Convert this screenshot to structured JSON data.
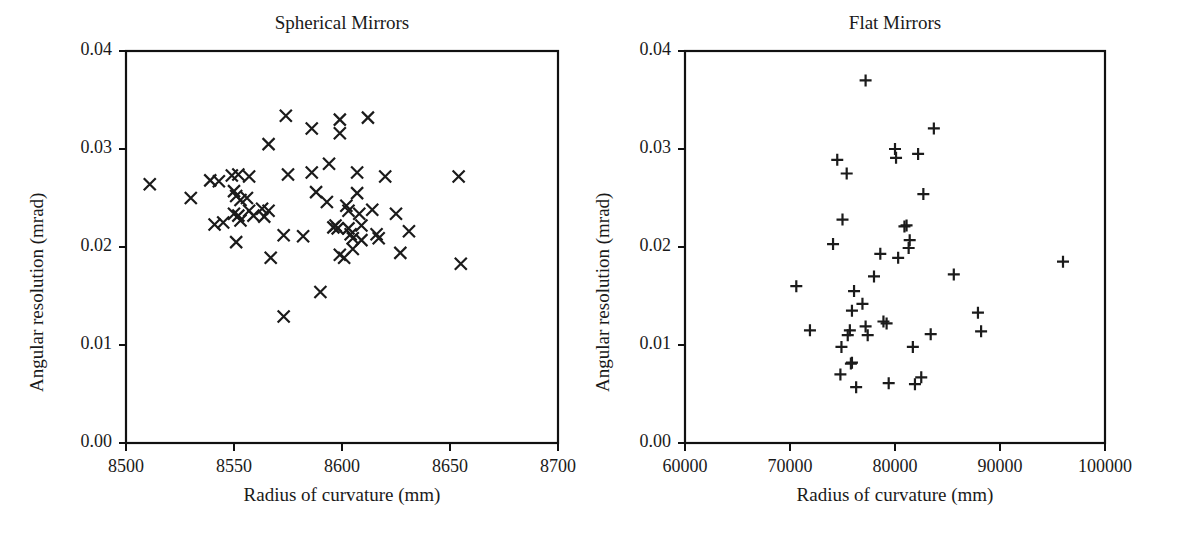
{
  "figure": {
    "width": 1178,
    "height": 535,
    "background": "#ffffff",
    "ink_color": "#1a1a1a"
  },
  "chart_data": [
    {
      "type": "scatter",
      "panel": "left",
      "title": "Spherical Mirrors",
      "xlabel": "Radius of curvature (mm)",
      "ylabel": "Angular resolution (mrad)",
      "xlim": [
        8500,
        8700
      ],
      "ylim": [
        0.0,
        0.04
      ],
      "xticks": [
        8500,
        8550,
        8600,
        8650,
        8700
      ],
      "xticklabels": [
        "8500",
        "8550",
        "8600",
        "8650",
        "8700"
      ],
      "yticks": [
        0.0,
        0.01,
        0.02,
        0.03,
        0.04
      ],
      "yticklabels": [
        "0.00",
        "0.01",
        "0.02",
        "0.03",
        "0.04"
      ],
      "grid": false,
      "legend": "none",
      "marker": "x",
      "marker_color": "#1b1b1b",
      "n_points": 63,
      "points": [
        [
          8511,
          0.0264
        ],
        [
          8530,
          0.025
        ],
        [
          8539,
          0.0268
        ],
        [
          8543,
          0.0267
        ],
        [
          8541,
          0.0223
        ],
        [
          8545,
          0.0225
        ],
        [
          8549,
          0.0273
        ],
        [
          8552,
          0.0274
        ],
        [
          8550,
          0.0257
        ],
        [
          8551,
          0.0252
        ],
        [
          8553,
          0.0248
        ],
        [
          8550,
          0.0234
        ],
        [
          8552,
          0.0232
        ],
        [
          8553,
          0.0227
        ],
        [
          8551,
          0.0205
        ],
        [
          8557,
          0.0272
        ],
        [
          8556,
          0.025
        ],
        [
          8557,
          0.0237
        ],
        [
          8559,
          0.0232
        ],
        [
          8563,
          0.0239
        ],
        [
          8566,
          0.0237
        ],
        [
          8564,
          0.0231
        ],
        [
          8566,
          0.0305
        ],
        [
          8567,
          0.0189
        ],
        [
          8574,
          0.0334
        ],
        [
          8575,
          0.0274
        ],
        [
          8573,
          0.0212
        ],
        [
          8573,
          0.0129
        ],
        [
          8582,
          0.0211
        ],
        [
          8586,
          0.0321
        ],
        [
          8586,
          0.0276
        ],
        [
          8588,
          0.0256
        ],
        [
          8590,
          0.0154
        ],
        [
          8594,
          0.0285
        ],
        [
          8593,
          0.0246
        ],
        [
          8596,
          0.022
        ],
        [
          8597,
          0.0222
        ],
        [
          8598,
          0.0219
        ],
        [
          8599,
          0.033
        ],
        [
          8599,
          0.0316
        ],
        [
          8599,
          0.0192
        ],
        [
          8601,
          0.0189
        ],
        [
          8602,
          0.0242
        ],
        [
          8603,
          0.0237
        ],
        [
          8603,
          0.0219
        ],
        [
          8604,
          0.0213
        ],
        [
          8605,
          0.0209
        ],
        [
          8605,
          0.0198
        ],
        [
          8607,
          0.0276
        ],
        [
          8607,
          0.0255
        ],
        [
          8608,
          0.0234
        ],
        [
          8609,
          0.0222
        ],
        [
          8609,
          0.0207
        ],
        [
          8612,
          0.0332
        ],
        [
          8614,
          0.0238
        ],
        [
          8616,
          0.0213
        ],
        [
          8617,
          0.0209
        ],
        [
          8620,
          0.0272
        ],
        [
          8625,
          0.0234
        ],
        [
          8627,
          0.0194
        ],
        [
          8631,
          0.0216
        ],
        [
          8654,
          0.0272
        ],
        [
          8655,
          0.0183
        ]
      ]
    },
    {
      "type": "scatter",
      "panel": "right",
      "title": "Flat Mirrors",
      "xlabel": "Radius of curvature (mm)",
      "ylabel": "Angular resolution (mrad)",
      "xlim": [
        60000,
        100000
      ],
      "ylim": [
        0.0,
        0.04
      ],
      "xticks": [
        60000,
        70000,
        80000,
        90000,
        100000
      ],
      "xticklabels": [
        "60000",
        "70000",
        "80000",
        "90000",
        "100000"
      ],
      "yticks": [
        0.0,
        0.01,
        0.02,
        0.03,
        0.04
      ],
      "yticklabels": [
        "0.00",
        "0.01",
        "0.02",
        "0.03",
        "0.04"
      ],
      "grid": false,
      "legend": "none",
      "marker": "plus",
      "marker_color": "#1b1b1b",
      "n_points": 47,
      "points": [
        [
          70600,
          0.016
        ],
        [
          71900,
          0.0115
        ],
        [
          74100,
          0.0203
        ],
        [
          74500,
          0.0289
        ],
        [
          75000,
          0.0228
        ],
        [
          74900,
          0.0098
        ],
        [
          74800,
          0.007
        ],
        [
          75400,
          0.0275
        ],
        [
          75500,
          0.011
        ],
        [
          75900,
          0.0135
        ],
        [
          75700,
          0.0115
        ],
        [
          75900,
          0.0082
        ],
        [
          75800,
          0.0081
        ],
        [
          76100,
          0.0155
        ],
        [
          76300,
          0.0057
        ],
        [
          77200,
          0.037
        ],
        [
          76900,
          0.0142
        ],
        [
          77200,
          0.0119
        ],
        [
          77400,
          0.011
        ],
        [
          78000,
          0.017
        ],
        [
          78600,
          0.0193
        ],
        [
          78900,
          0.0124
        ],
        [
          79200,
          0.0122
        ],
        [
          79400,
          0.0061
        ],
        [
          80000,
          0.03
        ],
        [
          80100,
          0.0291
        ],
        [
          80300,
          0.0189
        ],
        [
          80900,
          0.0221
        ],
        [
          81100,
          0.0222
        ],
        [
          81400,
          0.0207
        ],
        [
          81300,
          0.0199
        ],
        [
          81700,
          0.0098
        ],
        [
          81900,
          0.006
        ],
        [
          82200,
          0.0295
        ],
        [
          82700,
          0.0254
        ],
        [
          82500,
          0.0067
        ],
        [
          83700,
          0.0321
        ],
        [
          83400,
          0.0111
        ],
        [
          85600,
          0.0172
        ],
        [
          87900,
          0.0133
        ],
        [
          88200,
          0.0114
        ],
        [
          96000,
          0.0185
        ]
      ]
    }
  ]
}
